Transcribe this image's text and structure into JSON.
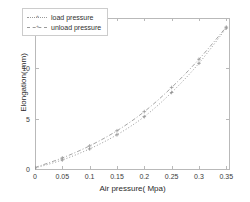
{
  "chart_data": {
    "type": "line",
    "title": "",
    "xlabel": "Air pressure( Mpa)",
    "ylabel": "Elongation( mm)",
    "xlim": [
      0,
      0.355
    ],
    "ylim": [
      0,
      15
    ],
    "xticks": [
      "0",
      "0.05",
      "0.1",
      "0.15",
      "0.2",
      "0.25",
      "0.3",
      "0.35"
    ],
    "xtick_values": [
      0,
      0.05,
      0.1,
      0.15,
      0.2,
      0.25,
      0.3,
      0.35
    ],
    "yticks": [
      "0",
      "5",
      "10",
      "15"
    ],
    "ytick_values": [
      0,
      5,
      10,
      15
    ],
    "grid": false,
    "legend_position": "upper left",
    "series": [
      {
        "name": "load pressure",
        "marker": "plus",
        "linestyle": "dotted",
        "color": "#8d8d8d",
        "x": [
          0,
          0.05,
          0.1,
          0.15,
          0.2,
          0.25,
          0.3,
          0.35
        ],
        "y": [
          0.1,
          0.9,
          2.0,
          3.4,
          5.2,
          7.6,
          10.5,
          14.0
        ]
      },
      {
        "name": "unload pressure",
        "marker": "plus",
        "linestyle": "dashdot",
        "color": "#9a9a9a",
        "x": [
          0,
          0.05,
          0.1,
          0.15,
          0.2,
          0.25,
          0.3,
          0.35
        ],
        "y": [
          0.15,
          1.1,
          2.3,
          3.8,
          5.7,
          8.1,
          10.9,
          14.1
        ]
      }
    ]
  },
  "legend": {
    "items": [
      {
        "label": "load pressure"
      },
      {
        "label": "unload pressure"
      }
    ]
  },
  "axes": {
    "xlabel": "Air pressure( Mpa)",
    "ylabel": "Elongation( mm)"
  }
}
